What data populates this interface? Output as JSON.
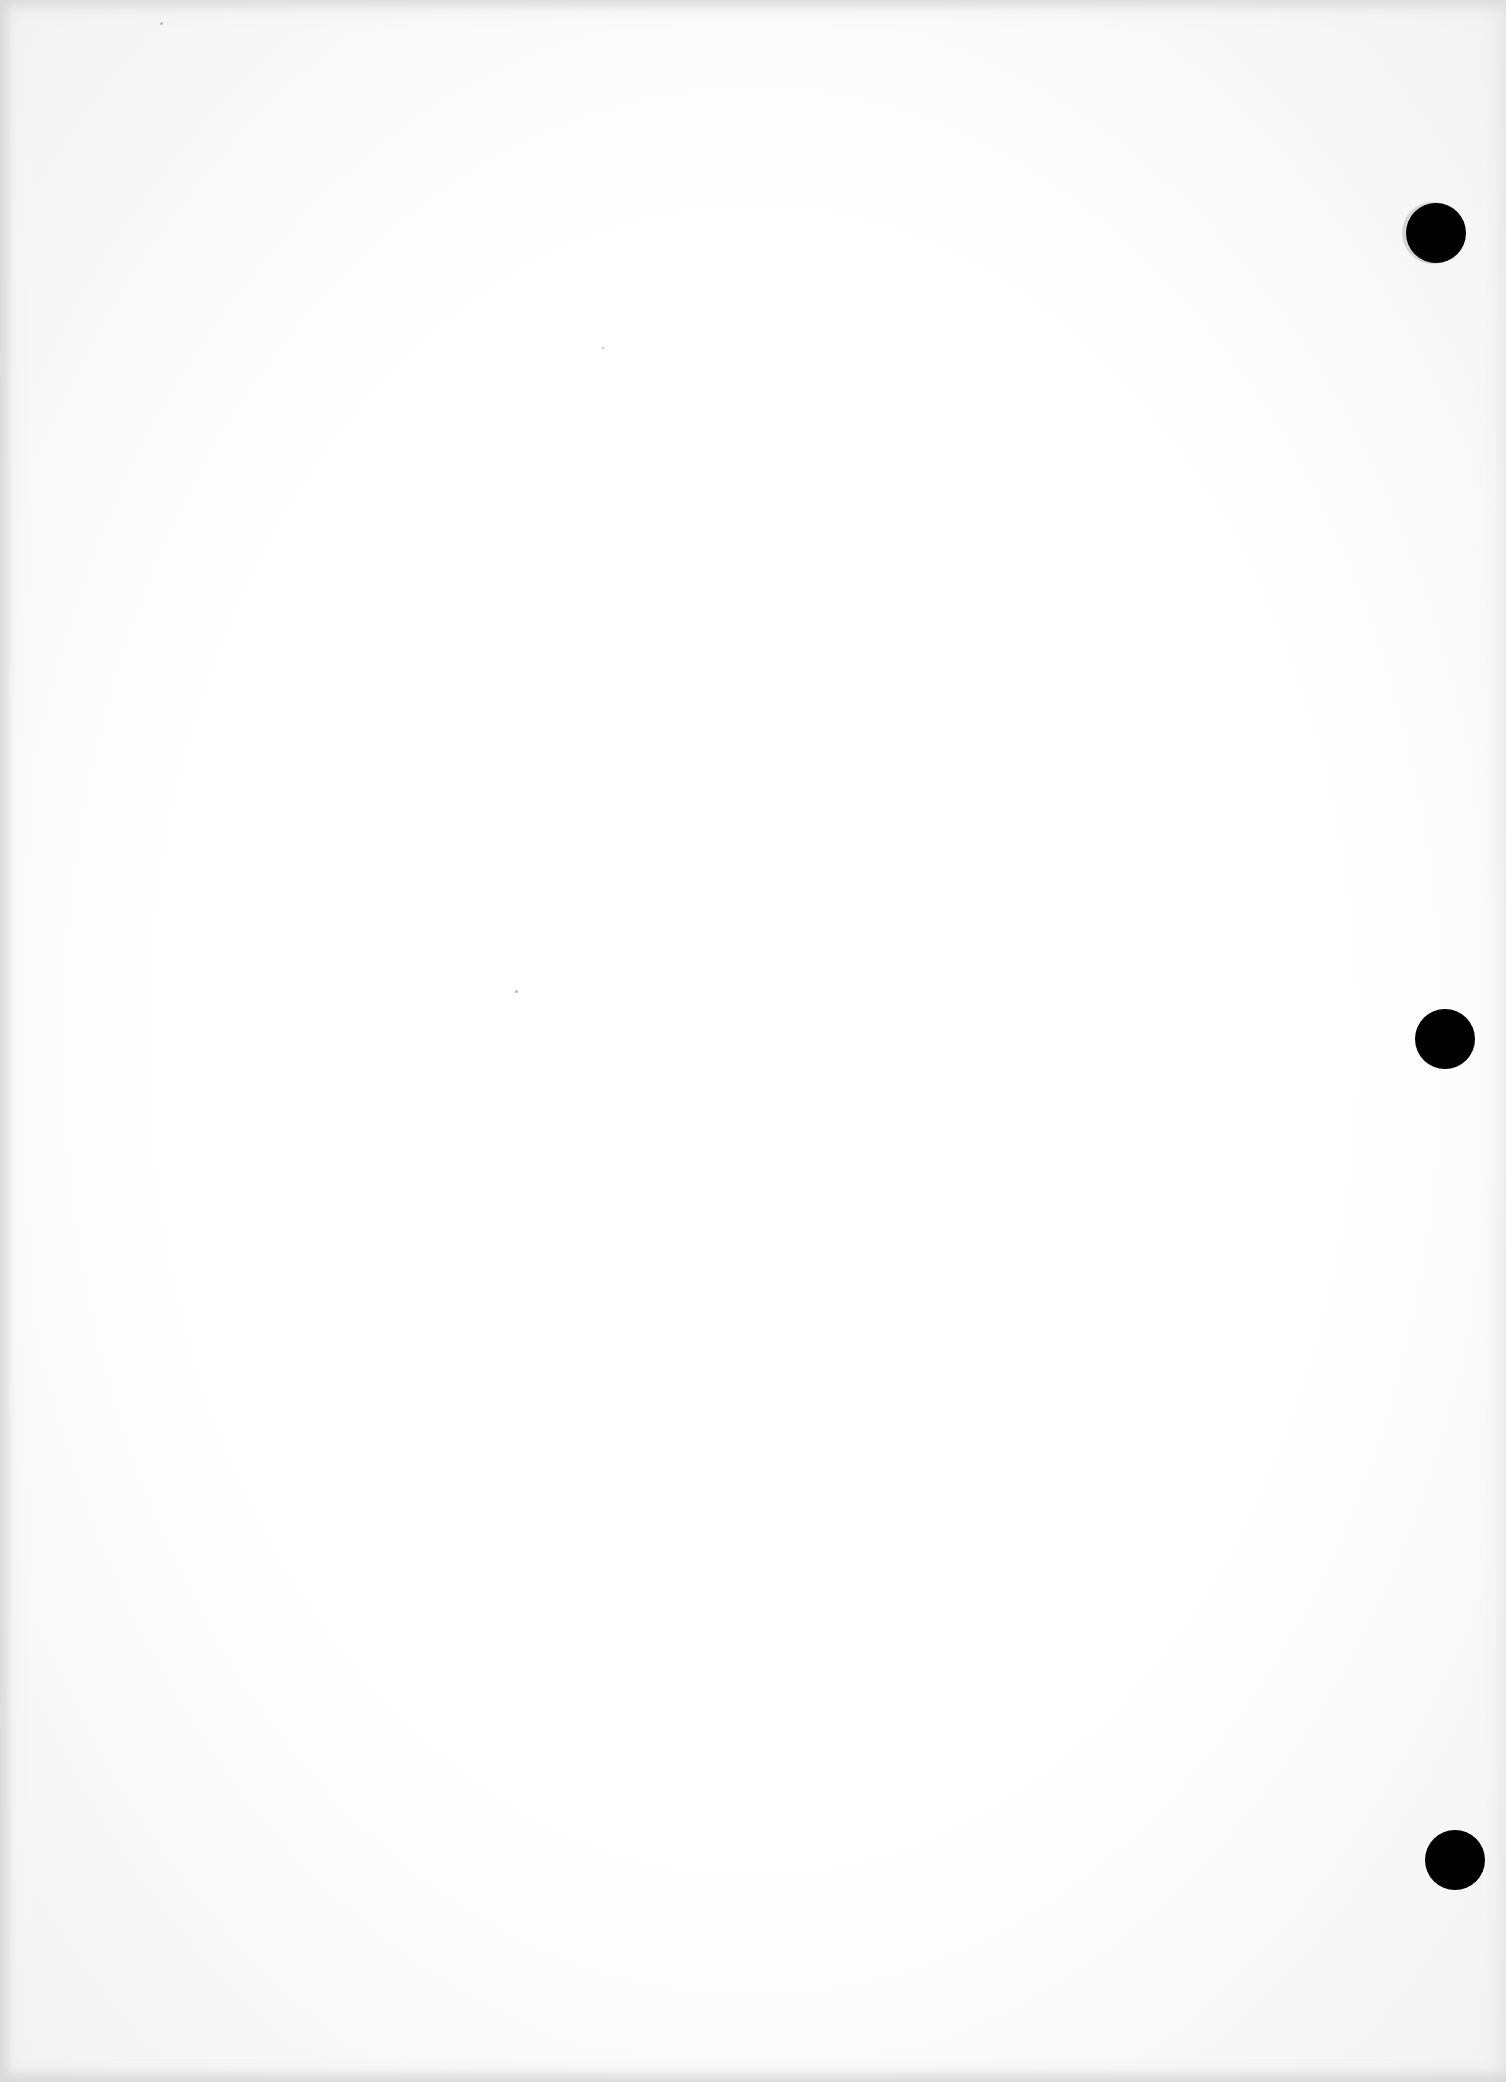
{
  "document": {
    "type": "scanned-blank-page",
    "text": "",
    "background_color": "#fdfdfd",
    "punch_holes": [
      {
        "name": "top-hole",
        "cx": 1436,
        "cy": 233,
        "r": 30,
        "color": "#000000"
      },
      {
        "name": "middle-hole",
        "cx": 1445,
        "cy": 1039,
        "r": 30,
        "color": "#000000"
      },
      {
        "name": "bottom-hole",
        "cx": 1455,
        "cy": 1860,
        "r": 30,
        "color": "#000000"
      }
    ]
  }
}
